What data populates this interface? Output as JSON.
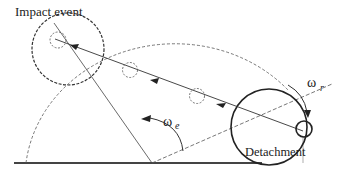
{
  "diagram": {
    "labels": {
      "impact_event": "Impact event",
      "detachment": "Detachment",
      "omega_r": "ω",
      "omega_r_sub": "r",
      "omega_e": "ω",
      "omega_e_sub": "e"
    },
    "colors": {
      "line": "#333333",
      "ground": "#444444",
      "background": "#ffffff"
    }
  }
}
